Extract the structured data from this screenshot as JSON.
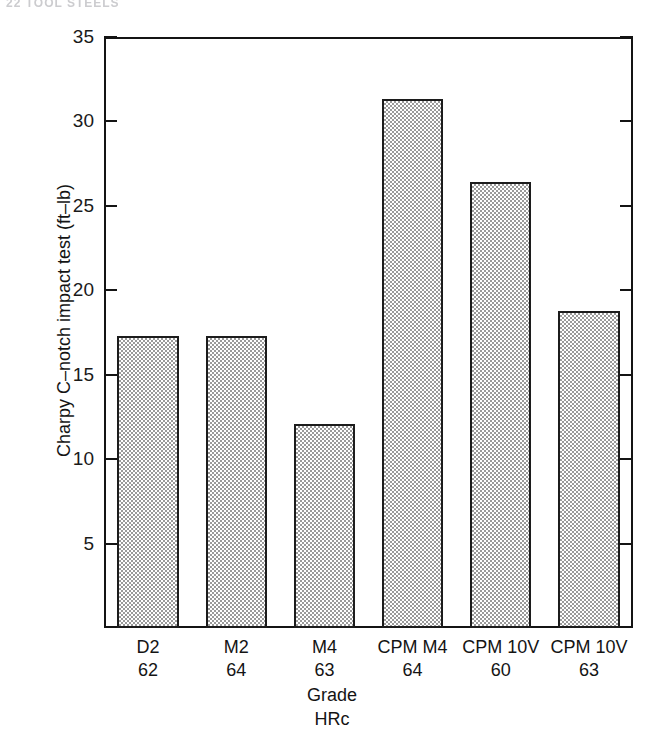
{
  "page_header": "22  TOOL STEELS",
  "chart_data": {
    "type": "bar",
    "title": "",
    "xlabel": "Grade",
    "xlabel_line2": "HRc",
    "ylabel": "Charpy C–notch impact test (ft–lb)",
    "ylim": [
      0,
      35
    ],
    "yticks": [
      5,
      10,
      15,
      20,
      25,
      30,
      35
    ],
    "ytick_labels": [
      "5",
      "10",
      "15",
      "20",
      "25",
      "30",
      "35"
    ],
    "grid": false,
    "legend": "none",
    "categories": [
      "D2",
      "M2",
      "M4",
      "CPM M4",
      "CPM 10V",
      "CPM 10V"
    ],
    "hrc": [
      "62",
      "64",
      "63",
      "64",
      "60",
      "63"
    ],
    "values": [
      17.3,
      17.3,
      12.1,
      31.3,
      26.4,
      18.8
    ],
    "bars": [
      {
        "grade": "D2",
        "hrc": "62",
        "value": 17.3
      },
      {
        "grade": "M2",
        "hrc": "64",
        "value": 17.3
      },
      {
        "grade": "M4",
        "hrc": "63",
        "value": 12.1
      },
      {
        "grade": "CPM M4",
        "hrc": "64",
        "value": 31.3
      },
      {
        "grade": "CPM 10V",
        "hrc": "60",
        "value": 26.4
      },
      {
        "grade": "CPM 10V",
        "hrc": "63",
        "value": 18.8
      }
    ],
    "colors": {
      "bar_fill": "#9a9a9a",
      "bar_edge": "#1c1c1c",
      "axis": "#141414",
      "background": "#ffffff"
    }
  }
}
